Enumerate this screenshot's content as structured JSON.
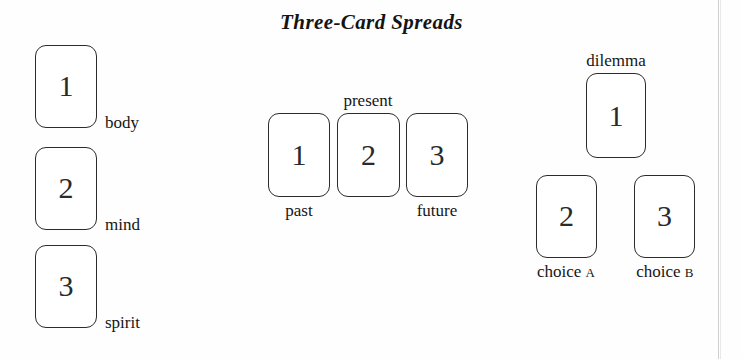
{
  "figure": {
    "title": "Three-Card Spreads"
  },
  "spreads": [
    {
      "name": "body-mind-spirit",
      "layout": "vertical-stack",
      "cards": [
        {
          "number": "1",
          "label": "body",
          "label_position": "right"
        },
        {
          "number": "2",
          "label": "mind",
          "label_position": "right"
        },
        {
          "number": "3",
          "label": "spirit",
          "label_position": "right"
        }
      ]
    },
    {
      "name": "past-present-future",
      "layout": "horizontal-row",
      "cards": [
        {
          "number": "1",
          "label": "past",
          "label_position": "below"
        },
        {
          "number": "2",
          "label": "present",
          "label_position": "above"
        },
        {
          "number": "3",
          "label": "future",
          "label_position": "below"
        }
      ]
    },
    {
      "name": "dilemma-choices",
      "layout": "triangle",
      "cards": [
        {
          "number": "1",
          "label": "dilemma",
          "label_position": "above"
        },
        {
          "number": "2",
          "label": "choice",
          "label_suffix": "A",
          "label_position": "below"
        },
        {
          "number": "3",
          "label": "choice",
          "label_suffix": "B",
          "label_position": "below"
        }
      ]
    }
  ],
  "colors": {
    "background": "#fefefe",
    "ink": "#1b1b1b",
    "card_border": "#2b2b2b",
    "card_fill": "#ffffff",
    "scan_edge": "#bfbfbf"
  }
}
